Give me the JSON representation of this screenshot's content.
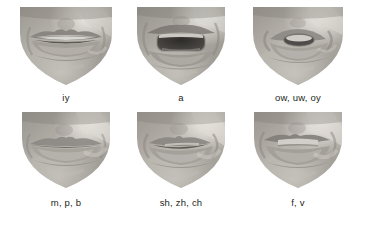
{
  "figure": {
    "background_color": "#ffffff",
    "text_color": "#231f20",
    "columns": 3,
    "rows": 2
  },
  "panels": [
    {
      "id": "panel-iy",
      "label": "iy",
      "phonemes": [
        "iy"
      ],
      "mouth_state": "wide slightly-open smile, upper teeth visible",
      "row": 1,
      "column": 1,
      "image_kind": "grayscale-photo-lower-face"
    },
    {
      "id": "panel-a",
      "label": "a",
      "phonemes": [
        "a"
      ],
      "mouth_state": "wide open, dark oral cavity, upper teeth edge visible",
      "row": 1,
      "column": 2,
      "image_kind": "grayscale-photo-lower-face"
    },
    {
      "id": "panel-ow-uw-oy",
      "label": "ow, uw, oy",
      "phonemes": [
        "ow",
        "uw",
        "oy"
      ],
      "mouth_state": "rounded puckered lips, small oval opening",
      "row": 1,
      "column": 3,
      "image_kind": "grayscale-photo-lower-face"
    },
    {
      "id": "panel-m-p-b",
      "label": "m, p, b",
      "phonemes": [
        "m",
        "p",
        "b"
      ],
      "mouth_state": "lips pressed closed",
      "row": 2,
      "column": 1,
      "image_kind": "grayscale-photo-lower-face"
    },
    {
      "id": "panel-sh-zh-ch",
      "label": "sh, zh, ch",
      "phonemes": [
        "sh",
        "zh",
        "ch"
      ],
      "mouth_state": "lips slightly protruded, narrow horizontal opening",
      "row": 2,
      "column": 2,
      "image_kind": "grayscale-photo-lower-face"
    },
    {
      "id": "panel-f-v",
      "label": "f, v",
      "phonemes": [
        "f",
        "v"
      ],
      "mouth_state": "upper teeth resting on lower lip",
      "row": 2,
      "column": 3,
      "image_kind": "grayscale-photo-lower-face"
    }
  ]
}
